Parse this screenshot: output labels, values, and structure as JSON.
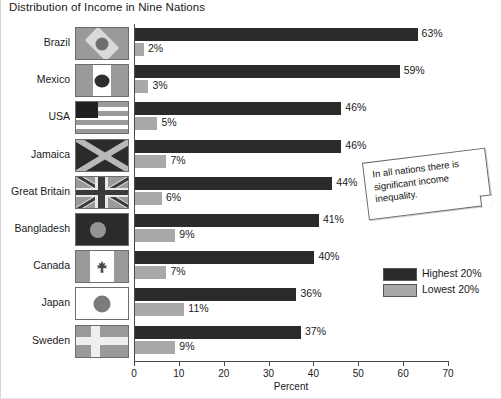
{
  "title": "Distribution of Income in Nine Nations",
  "axis": {
    "xlabel": "Percent",
    "ticks": [
      "0",
      "10",
      "20",
      "30",
      "40",
      "50",
      "60",
      "70"
    ]
  },
  "legend": {
    "items": [
      {
        "label": "Highest 20%",
        "swatch": "highest-20-swatch"
      },
      {
        "label": "Lowest 20%",
        "swatch": "lowest-20-swatch"
      }
    ]
  },
  "callout": {
    "text": "In all nations there is significant income inequality."
  },
  "rows": [
    {
      "country": "Brazil",
      "flag": "brazil-flag",
      "highest": "63%",
      "lowest": "2%"
    },
    {
      "country": "Mexico",
      "flag": "mexico-flag",
      "highest": "59%",
      "lowest": "3%"
    },
    {
      "country": "USA",
      "flag": "usa-flag",
      "highest": "46%",
      "lowest": "5%"
    },
    {
      "country": "Jamaica",
      "flag": "jamaica-flag",
      "highest": "46%",
      "lowest": "7%"
    },
    {
      "country": "Great Britain",
      "flag": "great-britain-flag",
      "highest": "44%",
      "lowest": "6%"
    },
    {
      "country": "Bangladesh",
      "flag": "bangladesh-flag",
      "highest": "41%",
      "lowest": "9%"
    },
    {
      "country": "Canada",
      "flag": "canada-flag",
      "highest": "40%",
      "lowest": "7%"
    },
    {
      "country": "Japan",
      "flag": "japan-flag",
      "highest": "36%",
      "lowest": "11%"
    },
    {
      "country": "Sweden",
      "flag": "sweden-flag",
      "highest": "37%",
      "lowest": "9%"
    }
  ],
  "colors": {
    "highest": "#2b2b2b",
    "lowest": "#a9a9a9",
    "axis": "#4a4a4a",
    "text": "#1a1a1a"
  },
  "chart_data": {
    "type": "bar",
    "title": "Distribution of Income in Nine Nations",
    "xlabel": "Percent",
    "ylabel": "",
    "orientation": "horizontal",
    "xlim": [
      0,
      70
    ],
    "xticks": [
      0,
      10,
      20,
      30,
      40,
      50,
      60,
      70
    ],
    "grid": false,
    "legend_position": "right-bottom",
    "categories": [
      "Brazil",
      "Mexico",
      "USA",
      "Jamaica",
      "Great Britain",
      "Bangladesh",
      "Canada",
      "Japan",
      "Sweden"
    ],
    "series": [
      {
        "name": "Highest 20%",
        "color": "#2b2b2b",
        "values": [
          63,
          59,
          46,
          46,
          44,
          41,
          40,
          36,
          37
        ]
      },
      {
        "name": "Lowest 20%",
        "color": "#a9a9a9",
        "values": [
          2,
          3,
          5,
          7,
          6,
          9,
          7,
          11,
          9
        ]
      }
    ],
    "annotations": [
      "In all nations there is significant income inequality."
    ]
  }
}
